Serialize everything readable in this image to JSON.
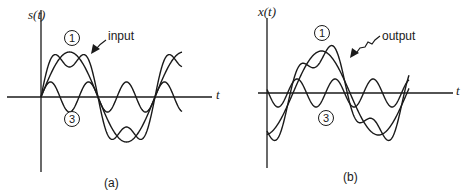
{
  "panels": [
    {
      "id": "a",
      "caption": "(a)",
      "y_axis_label": "s(t)",
      "x_axis_label": "t",
      "curve_labels": {
        "fundamental": "1",
        "third_harmonic": "3"
      },
      "arrow_label": "input",
      "description": "Input square-wave approximation: sum of fundamental (1) and third harmonic (3), starting at phase zero"
    },
    {
      "id": "b",
      "caption": "(b)",
      "y_axis_label": "x(t)",
      "x_axis_label": "t",
      "curve_labels": {
        "fundamental": "1",
        "third_harmonic": "3"
      },
      "arrow_label": "output",
      "description": "Output waveform with phase-shifted components; shape distorted relative to input"
    }
  ],
  "colors": {
    "ink": "#1a1a1a",
    "background": "#ffffff"
  }
}
